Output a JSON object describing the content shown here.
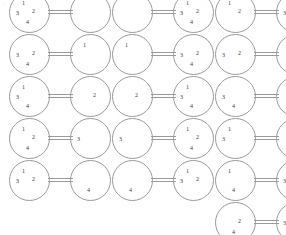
{
  "figure": {
    "stroke_color": "#9a9a9a",
    "pip_color": "#3a3a3a",
    "background": "#ffffff",
    "stray_mark": "+",
    "pip_labels": [
      "1",
      "2",
      "3",
      "4"
    ],
    "columns": 3,
    "rows": 5,
    "node_diameter_px": 41,
    "domino_pitch_x_px": 103,
    "domino_pitch_y_px": 42
  },
  "dominoes": [
    {
      "id": "r1c1",
      "col": 0,
      "row": 0,
      "x": 29,
      "y": 12,
      "left": [
        "1",
        "2",
        "3",
        "4"
      ],
      "right": []
    },
    {
      "id": "r1c2",
      "col": 1,
      "row": 0,
      "x": 132,
      "y": 12,
      "left": [],
      "right": [
        "1",
        "2",
        "3",
        "4"
      ]
    },
    {
      "id": "r1c3",
      "col": 2,
      "row": 0,
      "x": 235,
      "y": 12,
      "left": [
        "1",
        "2"
      ],
      "right": [
        "3",
        "4"
      ]
    },
    {
      "id": "r2c1",
      "col": 0,
      "row": 1,
      "x": 29,
      "y": 54,
      "left": [
        "2",
        "3",
        "4"
      ],
      "right": [
        "1"
      ]
    },
    {
      "id": "r2c2",
      "col": 1,
      "row": 1,
      "x": 132,
      "y": 54,
      "left": [
        "1"
      ],
      "right": [
        "2",
        "3",
        "4"
      ]
    },
    {
      "id": "r2c3",
      "col": 2,
      "row": 1,
      "x": 235,
      "y": 54,
      "left": [
        "2",
        "3"
      ],
      "right": [
        "1",
        "4"
      ]
    },
    {
      "id": "r3c1",
      "col": 0,
      "row": 2,
      "x": 29,
      "y": 96,
      "left": [
        "1",
        "3",
        "4"
      ],
      "right": [
        "2"
      ]
    },
    {
      "id": "r3c2",
      "col": 1,
      "row": 2,
      "x": 132,
      "y": 96,
      "left": [
        "2"
      ],
      "right": [
        "1",
        "3",
        "4"
      ]
    },
    {
      "id": "r3c3",
      "col": 2,
      "row": 2,
      "x": 235,
      "y": 96,
      "left": [
        "3",
        "4"
      ],
      "right": [
        "1",
        "2"
      ]
    },
    {
      "id": "r4c1",
      "col": 0,
      "row": 3,
      "x": 29,
      "y": 138,
      "left": [
        "1",
        "2",
        "4"
      ],
      "right": [
        "3"
      ]
    },
    {
      "id": "r4c2",
      "col": 1,
      "row": 3,
      "x": 132,
      "y": 138,
      "left": [
        "3"
      ],
      "right": [
        "1",
        "2",
        "4"
      ]
    },
    {
      "id": "r4c3",
      "col": 2,
      "row": 3,
      "x": 235,
      "y": 138,
      "left": [
        "1",
        "3"
      ],
      "right": [
        "2",
        "4"
      ]
    },
    {
      "id": "r5c1",
      "col": 0,
      "row": 4,
      "x": 29,
      "y": 180,
      "left": [
        "1",
        "2",
        "3"
      ],
      "right": [
        "4"
      ]
    },
    {
      "id": "r5c2",
      "col": 1,
      "row": 4,
      "x": 132,
      "y": 180,
      "left": [
        "4"
      ],
      "right": [
        "1",
        "2",
        "3"
      ]
    },
    {
      "id": "r5c3",
      "col": 2,
      "row": 4,
      "x": 235,
      "y": 180,
      "left": [
        "1",
        "4"
      ],
      "right": [
        "2",
        "3"
      ]
    },
    {
      "id": "r6c3",
      "col": 2,
      "row": 5,
      "x": 235,
      "y": 222,
      "left": [
        "2",
        "4"
      ],
      "right": [
        "1",
        "3"
      ]
    }
  ]
}
